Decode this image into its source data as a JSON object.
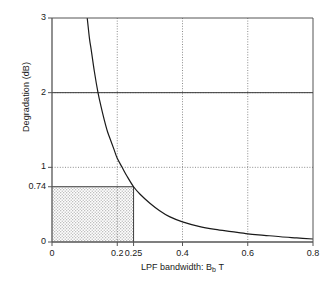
{
  "chart_data": {
    "type": "line",
    "title": "",
    "xlabel": "LPF bandwidth:  B_b T",
    "xlabel_parts": {
      "prefix": "LPF bandwidth:  B",
      "sub": "b",
      "suffix": "T"
    },
    "ylabel": "Degradation (dB)",
    "xlim": [
      0,
      0.8
    ],
    "ylim": [
      0,
      3
    ],
    "xticks": [
      0,
      0.2,
      0.25,
      0.4,
      0.6,
      0.8
    ],
    "xticklabels": [
      "0",
      "0.2",
      "0.25",
      "0.4",
      "0.6",
      "0.8"
    ],
    "yticks": [
      0,
      0.74,
      1,
      2,
      3
    ],
    "yticklabels": [
      "0",
      "0.74",
      "1",
      "2",
      "3"
    ],
    "grid": {
      "x_dotted_at": [
        0.2,
        0.4,
        0.6
      ],
      "y_dotted_at": [
        1,
        2
      ],
      "style": "dotted"
    },
    "legend": null,
    "series": [
      {
        "name": "Degradation vs LPF bandwidth",
        "color": "#1a1a1a",
        "x": [
          0.108,
          0.115,
          0.12,
          0.13,
          0.141,
          0.15,
          0.16,
          0.17,
          0.18,
          0.19,
          0.2,
          0.215,
          0.23,
          0.25,
          0.27,
          0.3,
          0.33,
          0.36,
          0.4,
          0.45,
          0.5,
          0.55,
          0.6,
          0.65,
          0.7,
          0.75,
          0.8
        ],
        "y": [
          3.0,
          2.72,
          2.58,
          2.28,
          2.0,
          1.82,
          1.64,
          1.48,
          1.36,
          1.24,
          1.12,
          1.0,
          0.88,
          0.74,
          0.64,
          0.52,
          0.42,
          0.34,
          0.27,
          0.21,
          0.17,
          0.14,
          0.11,
          0.09,
          0.07,
          0.055,
          0.04
        ]
      }
    ],
    "annotations": {
      "shaded_region": {
        "x_range": [
          0,
          0.25
        ],
        "y_range": [
          0,
          0.74
        ],
        "fill": "#d8d8d8",
        "description": "stippled operating region up to 0.74 dB at 0.25"
      },
      "marker_lines": [
        {
          "type": "horizontal",
          "value": 0.74,
          "from_x": 0,
          "to_x": 0.25
        },
        {
          "type": "vertical",
          "value": 0.25,
          "from_y": 0,
          "to_y": 0.74
        }
      ]
    },
    "axis_color": "#555555",
    "grid_color": "#7a7a7a"
  }
}
